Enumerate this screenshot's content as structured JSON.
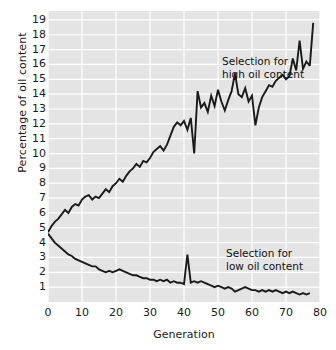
{
  "chart_data": {
    "type": "line",
    "title": "",
    "xlabel": "Generation",
    "ylabel": "Percentage of oil content",
    "xlim": [
      0,
      80
    ],
    "ylim": [
      0,
      19.6
    ],
    "xticks": [
      0,
      10,
      20,
      30,
      40,
      50,
      60,
      70,
      80
    ],
    "xtick_labels": [
      "0",
      "10",
      "20",
      "30",
      "40",
      "50",
      "60",
      "70",
      "80"
    ],
    "yticks": [
      1,
      2,
      3,
      4,
      5,
      6,
      7,
      8,
      9,
      10,
      11,
      12,
      13,
      14,
      15,
      16,
      17,
      18,
      19
    ],
    "ytick_labels": [
      "1",
      "2",
      "3",
      "4",
      "5",
      "6",
      "7",
      "8",
      "9",
      "10",
      "11",
      "12",
      "13",
      "14",
      "15",
      "16",
      "17",
      "18",
      "19"
    ],
    "grid": true,
    "grid_color": "#ffffff",
    "plot_background": "#e4e4e4",
    "line_color": "#1a1a1a",
    "annotations": [
      {
        "name": "high-oil-annotation",
        "text_line1": "Selection for",
        "text_line2": "high oil content"
      },
      {
        "name": "low-oil-annotation",
        "text_line1": "Selection for",
        "text_line2": "low oil content"
      }
    ],
    "series": [
      {
        "name": "Selection for high oil content",
        "x": [
          0,
          1,
          2,
          3,
          4,
          5,
          6,
          7,
          8,
          9,
          10,
          11,
          12,
          13,
          14,
          15,
          16,
          17,
          18,
          19,
          20,
          21,
          22,
          23,
          24,
          25,
          26,
          27,
          28,
          29,
          30,
          31,
          32,
          33,
          34,
          35,
          36,
          37,
          38,
          39,
          40,
          41,
          42,
          43,
          44,
          45,
          46,
          47,
          48,
          49,
          50,
          51,
          52,
          53,
          54,
          55,
          56,
          57,
          58,
          59,
          60,
          61,
          62,
          63,
          64,
          65,
          66,
          67,
          68,
          69,
          70,
          71,
          72,
          73,
          74,
          75,
          76,
          77
        ],
        "values": [
          4.7,
          5.1,
          5.4,
          5.6,
          5.9,
          6.2,
          6.0,
          6.4,
          6.6,
          6.5,
          6.9,
          7.1,
          7.2,
          6.9,
          7.1,
          7.0,
          7.3,
          7.6,
          7.4,
          7.8,
          8.0,
          8.3,
          8.1,
          8.5,
          8.8,
          9.0,
          9.3,
          9.1,
          9.5,
          9.4,
          9.7,
          10.1,
          10.3,
          10.5,
          10.2,
          10.6,
          11.2,
          11.8,
          12.1,
          11.9,
          12.2,
          11.6,
          12.4,
          10.0,
          14.2,
          13.1,
          13.4,
          12.8,
          13.9,
          13.2,
          14.3,
          13.5,
          12.9,
          13.6,
          14.2,
          15.4,
          14.0,
          13.8,
          14.4,
          13.5,
          13.9,
          11.9,
          13.1,
          13.8,
          14.2,
          14.6,
          14.5,
          14.9,
          15.1,
          15.3,
          15.0,
          15.2,
          16.4,
          15.6,
          17.6,
          15.7,
          16.2,
          15.9
        ]
      },
      {
        "name": "Selection for low oil content",
        "x": [
          0,
          1,
          2,
          3,
          4,
          5,
          6,
          7,
          8,
          9,
          10,
          11,
          12,
          13,
          14,
          15,
          16,
          17,
          18,
          19,
          20,
          21,
          22,
          23,
          24,
          25,
          26,
          27,
          28,
          29,
          30,
          31,
          32,
          33,
          34,
          35,
          36,
          37,
          38,
          39,
          40,
          41,
          42,
          43,
          44,
          45,
          46,
          47,
          48,
          49,
          50,
          51,
          52,
          53,
          54,
          55,
          56,
          57,
          58,
          59,
          60,
          61,
          62,
          63,
          64,
          65,
          66,
          67,
          68,
          69,
          70,
          71,
          72,
          73,
          74,
          75,
          76,
          77
        ],
        "values": [
          4.6,
          4.3,
          4.0,
          3.8,
          3.6,
          3.4,
          3.2,
          3.1,
          2.9,
          2.8,
          2.7,
          2.6,
          2.5,
          2.4,
          2.4,
          2.2,
          2.1,
          2.0,
          2.1,
          2.0,
          2.1,
          2.2,
          2.1,
          2.0,
          1.9,
          1.8,
          1.8,
          1.7,
          1.6,
          1.6,
          1.5,
          1.5,
          1.4,
          1.5,
          1.4,
          1.5,
          1.3,
          1.4,
          1.3,
          1.3,
          1.2,
          3.2,
          1.3,
          1.4,
          1.3,
          1.4,
          1.3,
          1.2,
          1.1,
          1.0,
          1.1,
          1.0,
          0.9,
          1.0,
          0.9,
          0.7,
          0.8,
          0.9,
          1.0,
          0.9,
          0.8,
          0.8,
          0.7,
          0.8,
          0.7,
          0.8,
          0.7,
          0.8,
          0.7,
          0.6,
          0.7,
          0.6,
          0.7,
          0.6,
          0.5,
          0.6,
          0.5,
          0.6
        ]
      }
    ]
  },
  "upper_last_value": 18.8
}
